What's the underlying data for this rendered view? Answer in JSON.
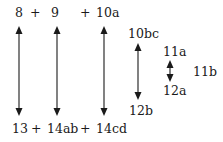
{
  "diagram": {
    "top_row": {
      "term1": "8",
      "plus1": "+",
      "term2": "9",
      "plus2": "+",
      "term3": "10a"
    },
    "bottom_row": {
      "term1": "13",
      "plus1": "+",
      "term2": "14ab",
      "plus2": "+",
      "term3": "14cd"
    },
    "mid_pair": {
      "top": "10bc",
      "bottom": "12b"
    },
    "small_pair": {
      "top": "11a",
      "bottom": "12a",
      "side": "11b"
    },
    "arrows": [
      {
        "from": "8",
        "to": "13",
        "type": "double-headed"
      },
      {
        "from": "9",
        "to": "14ab",
        "type": "double-headed"
      },
      {
        "from": "10a",
        "to": "14cd",
        "type": "double-headed"
      },
      {
        "from": "10bc",
        "to": "12b",
        "type": "double-headed"
      },
      {
        "from": "11a",
        "to": "12a",
        "type": "double-headed"
      }
    ],
    "colors": {
      "ink": "#1a1a1a",
      "background": "#ffffff"
    }
  }
}
